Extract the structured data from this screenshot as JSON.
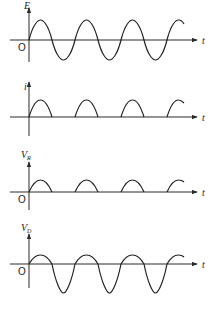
{
  "diagram": {
    "title": "",
    "panels": [
      {
        "id": "E",
        "ylabel": "E",
        "ysub": "",
        "xlabel": "t",
        "origin": "O",
        "waveform": "full sine"
      },
      {
        "id": "i",
        "ylabel": "i",
        "ysub": "",
        "xlabel": "t",
        "origin": "",
        "waveform": "half-wave rectified (positive lobes)"
      },
      {
        "id": "VR",
        "ylabel": "V",
        "ysub": "R",
        "xlabel": "t",
        "origin": "O",
        "waveform": "half-wave rectified (positive lobes)"
      },
      {
        "id": "VD",
        "ylabel": "V",
        "ysub": "D",
        "xlabel": "t",
        "origin": "O",
        "waveform": "small positive lobes, large negative lobes"
      }
    ],
    "colors": {
      "ink": "#222222",
      "background": "#ffffff"
    }
  }
}
